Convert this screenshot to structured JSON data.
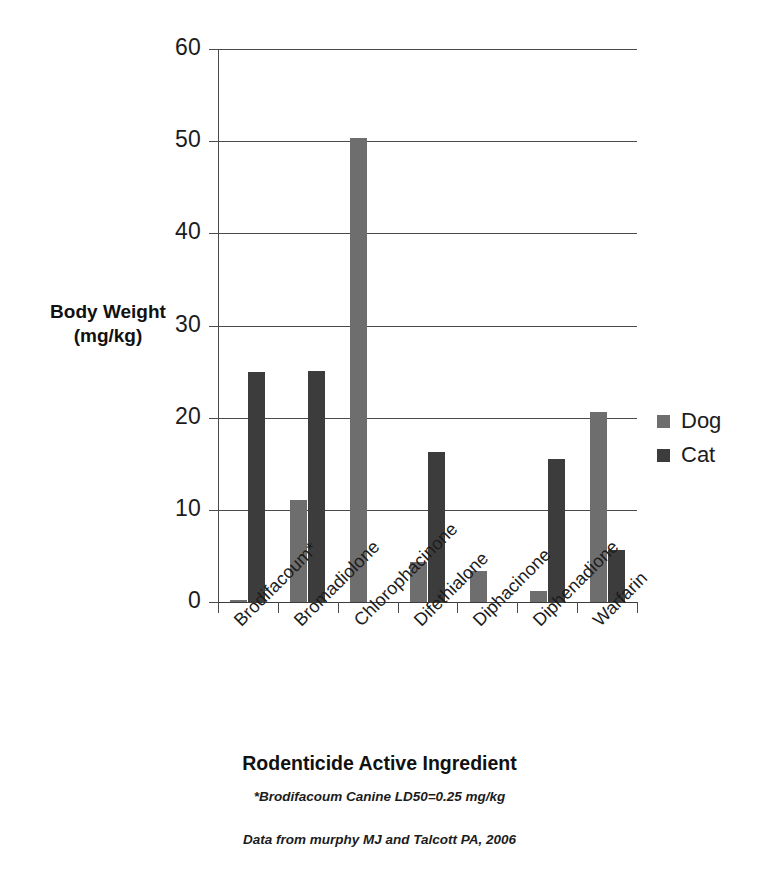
{
  "chart_data": {
    "type": "bar",
    "title": "",
    "xlabel": "Rodenticide Active Ingredient",
    "ylabel": "Body Weight\n(mg/kg)",
    "ylabel_line1": "Body Weight",
    "ylabel_line2": "(mg/kg)",
    "ylim": [
      0,
      60
    ],
    "yticks": [
      0,
      10,
      20,
      30,
      40,
      50,
      60
    ],
    "ytick_labels": [
      "0",
      "10",
      "20",
      "30",
      "40",
      "50",
      "60"
    ],
    "grid": true,
    "grid_axis": "y",
    "legend_position": "right",
    "categories": [
      "Brodifacoum*",
      "Bromadiolone",
      "Chlorophacinone",
      "Difethialone",
      "Diphacinone",
      "Diphenadione",
      "Warfarin"
    ],
    "series": [
      {
        "name": "Dog",
        "color": "#6e6e6e",
        "values": [
          0.25,
          11.1,
          50.3,
          4.3,
          3.4,
          1.2,
          20.6
        ]
      },
      {
        "name": "Cat",
        "color": "#3c3c3c",
        "values": [
          25.0,
          25.1,
          0,
          16.3,
          0,
          15.5,
          5.6
        ]
      }
    ],
    "annotations": [
      "*Brodifacoum Canine LD50=0.25 mg/kg",
      "Data from murphy MJ and Talcott PA, 2006"
    ]
  },
  "legend": {
    "items": [
      {
        "label": "Dog",
        "color": "#6e6e6e"
      },
      {
        "label": "Cat",
        "color": "#3c3c3c"
      }
    ]
  },
  "footnotes": {
    "note": "*Brodifacoum Canine LD50=0.25 mg/kg",
    "source": "Data from murphy MJ and Talcott PA, 2006"
  },
  "colors": {
    "dog": "#6e6e6e",
    "cat": "#3c3c3c",
    "axis": "#4a4a4a",
    "text": "#1c1c1c",
    "background": "#ffffff"
  }
}
